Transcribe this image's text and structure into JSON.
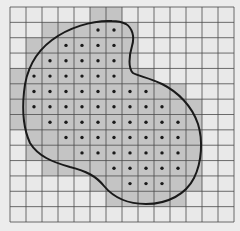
{
  "diagram": {
    "grid": {
      "cols": 14,
      "rows": 14,
      "x0": 10,
      "y0": 7,
      "x1": 234,
      "y1": 222
    },
    "colors": {
      "background": "#ececec",
      "cell_empty": "#e9e9e9",
      "cell_shaded": "#c4c4c4",
      "grid_line": "#4a4a4a",
      "dot": "#1a1a1a",
      "curve": "#1a1a1a"
    },
    "shaded_rows": [
      {
        "row": 0,
        "from": 5,
        "to": 6
      },
      {
        "row": 1,
        "from": 2,
        "to": 7
      },
      {
        "row": 2,
        "from": 1,
        "to": 7
      },
      {
        "row": 3,
        "from": 1,
        "to": 7
      },
      {
        "row": 4,
        "from": 0,
        "to": 8
      },
      {
        "row": 5,
        "from": 0,
        "to": 10
      },
      {
        "row": 6,
        "from": 0,
        "to": 11
      },
      {
        "row": 7,
        "from": 0,
        "to": 11
      },
      {
        "row": 8,
        "from": 1,
        "to": 11
      },
      {
        "row": 9,
        "from": 1,
        "to": 11
      },
      {
        "row": 10,
        "from": 2,
        "to": 11
      },
      {
        "row": 11,
        "from": 5,
        "to": 11
      },
      {
        "row": 12,
        "from": 6,
        "to": 10
      }
    ],
    "dot_rows": [
      {
        "row": 1,
        "from": 5,
        "to": 6
      },
      {
        "row": 2,
        "from": 3,
        "to": 6
      },
      {
        "row": 3,
        "from": 2,
        "to": 6
      },
      {
        "row": 4,
        "from": 1,
        "to": 6
      },
      {
        "row": 5,
        "from": 1,
        "to": 8
      },
      {
        "row": 6,
        "from": 1,
        "to": 9
      },
      {
        "row": 7,
        "from": 2,
        "to": 10
      },
      {
        "row": 8,
        "from": 3,
        "to": 10
      },
      {
        "row": 9,
        "from": 4,
        "to": 10
      },
      {
        "row": 10,
        "from": 6,
        "to": 10
      },
      {
        "row": 11,
        "from": 7,
        "to": 9
      }
    ],
    "curve_path": "M 112 21 C 92 20 68 28 52 40 C 36 52 26 70 24 92 C 22 112 24 130 30 143 C 38 156 52 162 70 167 C 86 171 96 176 104 186 C 114 198 128 204 146 204 C 168 204 186 194 194 178 C 202 162 203 140 198 124 C 192 106 178 92 162 84 C 150 78 138 76 133 73 C 128 68 129 56 132 46 C 135 36 132 28 126 24 C 122 22 117 21 112 21 Z"
  }
}
